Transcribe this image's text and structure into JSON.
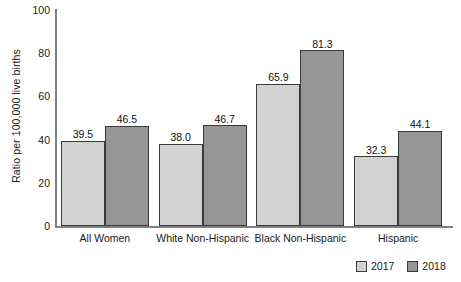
{
  "chart_data": {
    "type": "bar",
    "title": "",
    "xlabel": "",
    "ylabel": "Ratio per 100,000 live births",
    "ylim": [
      0,
      100
    ],
    "yticks": [
      0,
      20,
      40,
      60,
      80,
      100
    ],
    "grid": false,
    "legend_position": "bottom-right",
    "categories": [
      "All Women",
      "White Non-Hispanic",
      "Black Non-Hispanic",
      "Hispanic"
    ],
    "series": [
      {
        "name": "2017",
        "color": "#d2d2d2",
        "values": [
          39.5,
          38.0,
          65.9,
          32.3
        ],
        "labels": [
          "39.5",
          "38.0",
          "65.9",
          "32.3"
        ]
      },
      {
        "name": "2018",
        "color": "#969696",
        "values": [
          46.5,
          46.7,
          81.3,
          44.1
        ],
        "labels": [
          "46.5",
          "46.7",
          "81.3",
          "44.1"
        ]
      }
    ]
  },
  "axis": {
    "y_tick_labels": [
      "100",
      "80",
      "60",
      "40",
      "20",
      "0"
    ],
    "y_title": "Ratio per 100,000 live births"
  },
  "legend": {
    "items": [
      {
        "label": "2017",
        "swatch_icon": "legend-swatch-light"
      },
      {
        "label": "2018",
        "swatch_icon": "legend-swatch-dark"
      }
    ]
  }
}
